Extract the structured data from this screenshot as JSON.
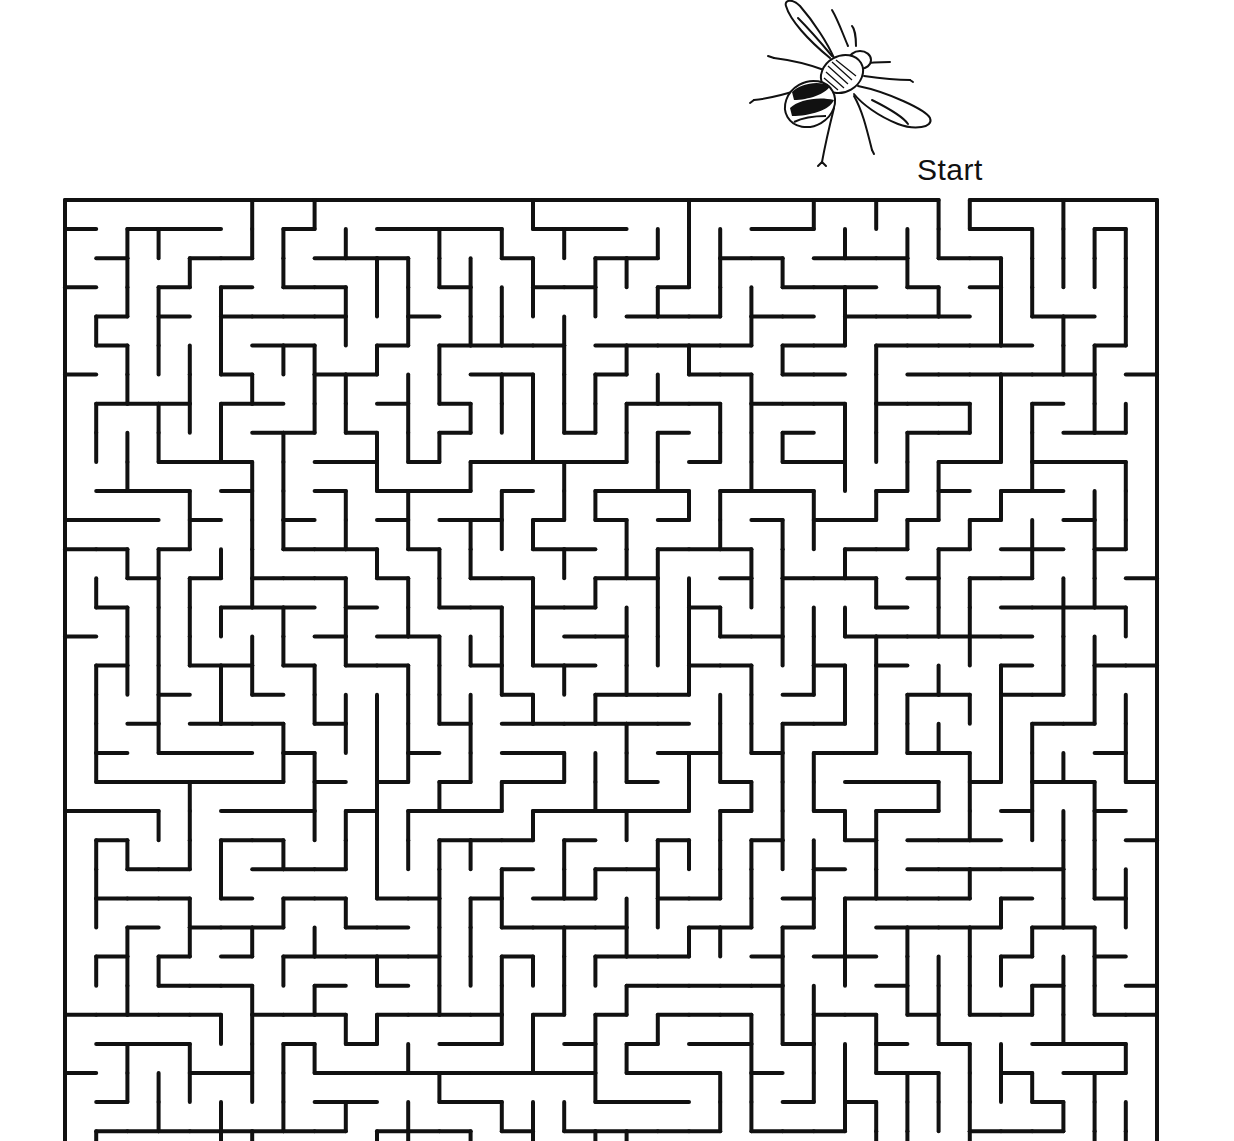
{
  "puzzle": {
    "type": "maze",
    "start_label": "Start",
    "illustration": "bee-icon"
  },
  "maze": {
    "columns": 35,
    "visible_rows": 33,
    "origin_x": 65,
    "origin_y": 200,
    "cell_width": 31.2,
    "cell_height": 29.1,
    "wall_color": "#111111",
    "wall_width": 4,
    "start_gap_column": 28,
    "seed": 73
  },
  "colors": {
    "background": "#ffffff",
    "ink": "#111111"
  }
}
